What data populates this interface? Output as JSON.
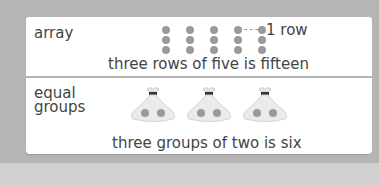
{
  "array_section": {
    "label": "array",
    "rows": 3,
    "columns": 5,
    "row_annotation": "1 row",
    "caption": "three rows of five is fifteen"
  },
  "groups_section": {
    "label_line1": "equal",
    "label_line2": "groups",
    "groups": 3,
    "items_per_group": 2,
    "caption": "three groups of two is six"
  },
  "colors": {
    "background": "#b5b5b5",
    "card": "#ffffff",
    "dot": "#9a9a9a",
    "text": "#444444"
  }
}
